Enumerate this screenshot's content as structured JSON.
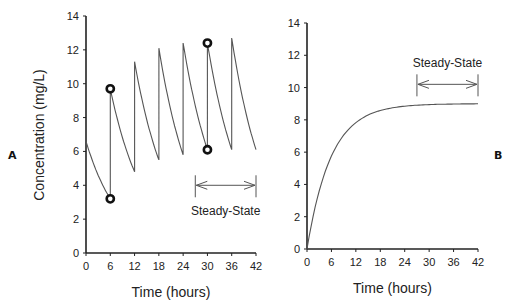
{
  "chart_data": [
    {
      "panel": "A",
      "type": "line",
      "title": "",
      "xlabel": "Time  (hours)",
      "ylabel": "Concentration  (mg/L)",
      "xlim": [
        0,
        42
      ],
      "ylim": [
        0,
        14
      ],
      "xticks": [
        0,
        6,
        12,
        18,
        24,
        30,
        36,
        42
      ],
      "yticks": [
        0,
        2,
        4,
        6,
        8,
        10,
        12,
        14
      ],
      "grid": false,
      "description": "Intermittent dosing every 6 hours - sawtooth concentration profile",
      "series": [
        {
          "name": "Concentration",
          "x": [
            0,
            6,
            6,
            12,
            12,
            18,
            18,
            24,
            24,
            30,
            30,
            36,
            36,
            42
          ],
          "y": [
            6.6,
            3.2,
            9.7,
            4.8,
            11.3,
            5.5,
            12.1,
            5.8,
            12.4,
            6.1,
            12.4,
            6.1,
            12.7,
            6.1
          ]
        }
      ],
      "markers": [
        {
          "x": 6,
          "y": 3.2
        },
        {
          "x": 6,
          "y": 9.7
        },
        {
          "x": 30,
          "y": 6.1
        },
        {
          "x": 30,
          "y": 12.4
        }
      ],
      "annotation": {
        "text": "Steady-State",
        "x_range": [
          27,
          42
        ],
        "y": 4
      }
    },
    {
      "panel": "B",
      "type": "line",
      "title": "",
      "xlabel": "Time  (hours)",
      "ylabel": "",
      "xlim": [
        0,
        42
      ],
      "ylim": [
        0,
        14
      ],
      "xticks": [
        0,
        6,
        12,
        18,
        24,
        30,
        36,
        42
      ],
      "yticks": [
        0,
        2,
        4,
        6,
        8,
        10,
        12,
        14
      ],
      "grid": false,
      "description": "Continuous infusion - exponential rise to plateau",
      "series": [
        {
          "name": "Concentration",
          "x": [
            0,
            3,
            6,
            9,
            12,
            15,
            18,
            21,
            24,
            27,
            30,
            33,
            36,
            39,
            42
          ],
          "y": [
            0,
            3.5,
            5.5,
            6.9,
            7.7,
            8.2,
            8.5,
            8.7,
            8.8,
            8.9,
            8.95,
            8.97,
            8.98,
            8.99,
            9.0
          ]
        }
      ],
      "annotation": {
        "text": "Steady-State",
        "x_range": [
          27,
          42
        ],
        "y": 10.2
      }
    }
  ],
  "labels": {
    "panel_a": "A",
    "panel_b": "B",
    "ylabel": "Concentration  (mg/L)",
    "xlabel": "Time  (hours)",
    "steady_state": "Steady-State"
  },
  "style": {
    "line_color": "#555555",
    "axis_color": "#222222"
  }
}
